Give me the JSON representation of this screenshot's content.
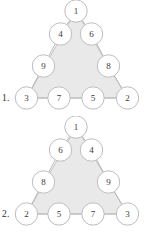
{
  "page": {
    "background_color": "#ffffff",
    "width": 155,
    "height": 232
  },
  "style": {
    "triangle_fill": "#e9e9e9",
    "triangle_stroke": "#c9c9c9",
    "edge_stroke": "#b8b8b8",
    "node_fill": "#ffffff",
    "node_stroke": "#bdbdbd",
    "node_text_color": "#3a3a3a",
    "label_text_color": "#2b2b2b",
    "node_radius": 11.2
  },
  "puzzles": [
    {
      "label": "1.",
      "name": "magic-triangle-1",
      "apex": {
        "value": "1"
      },
      "left_edge": [
        {
          "value": "4"
        },
        {
          "value": "9"
        }
      ],
      "right_edge": [
        {
          "value": "6"
        },
        {
          "value": "8"
        }
      ],
      "bottom_row": [
        {
          "value": "3"
        },
        {
          "value": "7"
        },
        {
          "value": "5"
        },
        {
          "value": "2"
        }
      ],
      "nodes": [
        {
          "id": "apex",
          "value": "1",
          "cx": 76,
          "cy": 11
        },
        {
          "id": "ul",
          "value": "4",
          "cx": 60.5,
          "cy": 34
        },
        {
          "id": "ur",
          "value": "6",
          "cx": 91.5,
          "cy": 34
        },
        {
          "id": "ml",
          "value": "9",
          "cx": 43.5,
          "cy": 66
        },
        {
          "id": "mr",
          "value": "8",
          "cx": 108.5,
          "cy": 66
        },
        {
          "id": "bl",
          "value": "3",
          "cx": 26.5,
          "cy": 98
        },
        {
          "id": "bml",
          "value": "7",
          "cx": 59,
          "cy": 98
        },
        {
          "id": "bmr",
          "value": "5",
          "cx": 93,
          "cy": 98
        },
        {
          "id": "br",
          "value": "2",
          "cx": 127.5,
          "cy": 98
        }
      ]
    },
    {
      "label": "2.",
      "name": "magic-triangle-2",
      "apex": {
        "value": "1"
      },
      "left_edge": [
        {
          "value": "6"
        },
        {
          "value": "8"
        }
      ],
      "right_edge": [
        {
          "value": "4"
        },
        {
          "value": "9"
        }
      ],
      "bottom_row": [
        {
          "value": "2"
        },
        {
          "value": "5"
        },
        {
          "value": "7"
        },
        {
          "value": "3"
        }
      ],
      "nodes": [
        {
          "id": "apex",
          "value": "1",
          "cx": 76,
          "cy": 11
        },
        {
          "id": "ul",
          "value": "6",
          "cx": 60.5,
          "cy": 34
        },
        {
          "id": "ur",
          "value": "4",
          "cx": 91.5,
          "cy": 34
        },
        {
          "id": "ml",
          "value": "8",
          "cx": 43.5,
          "cy": 66
        },
        {
          "id": "mr",
          "value": "9",
          "cx": 108.5,
          "cy": 66
        },
        {
          "id": "bl",
          "value": "2",
          "cx": 26.5,
          "cy": 98
        },
        {
          "id": "bml",
          "value": "5",
          "cx": 59,
          "cy": 98
        },
        {
          "id": "bmr",
          "value": "7",
          "cx": 93,
          "cy": 98
        },
        {
          "id": "br",
          "value": "3",
          "cx": 127.5,
          "cy": 98
        }
      ]
    }
  ]
}
